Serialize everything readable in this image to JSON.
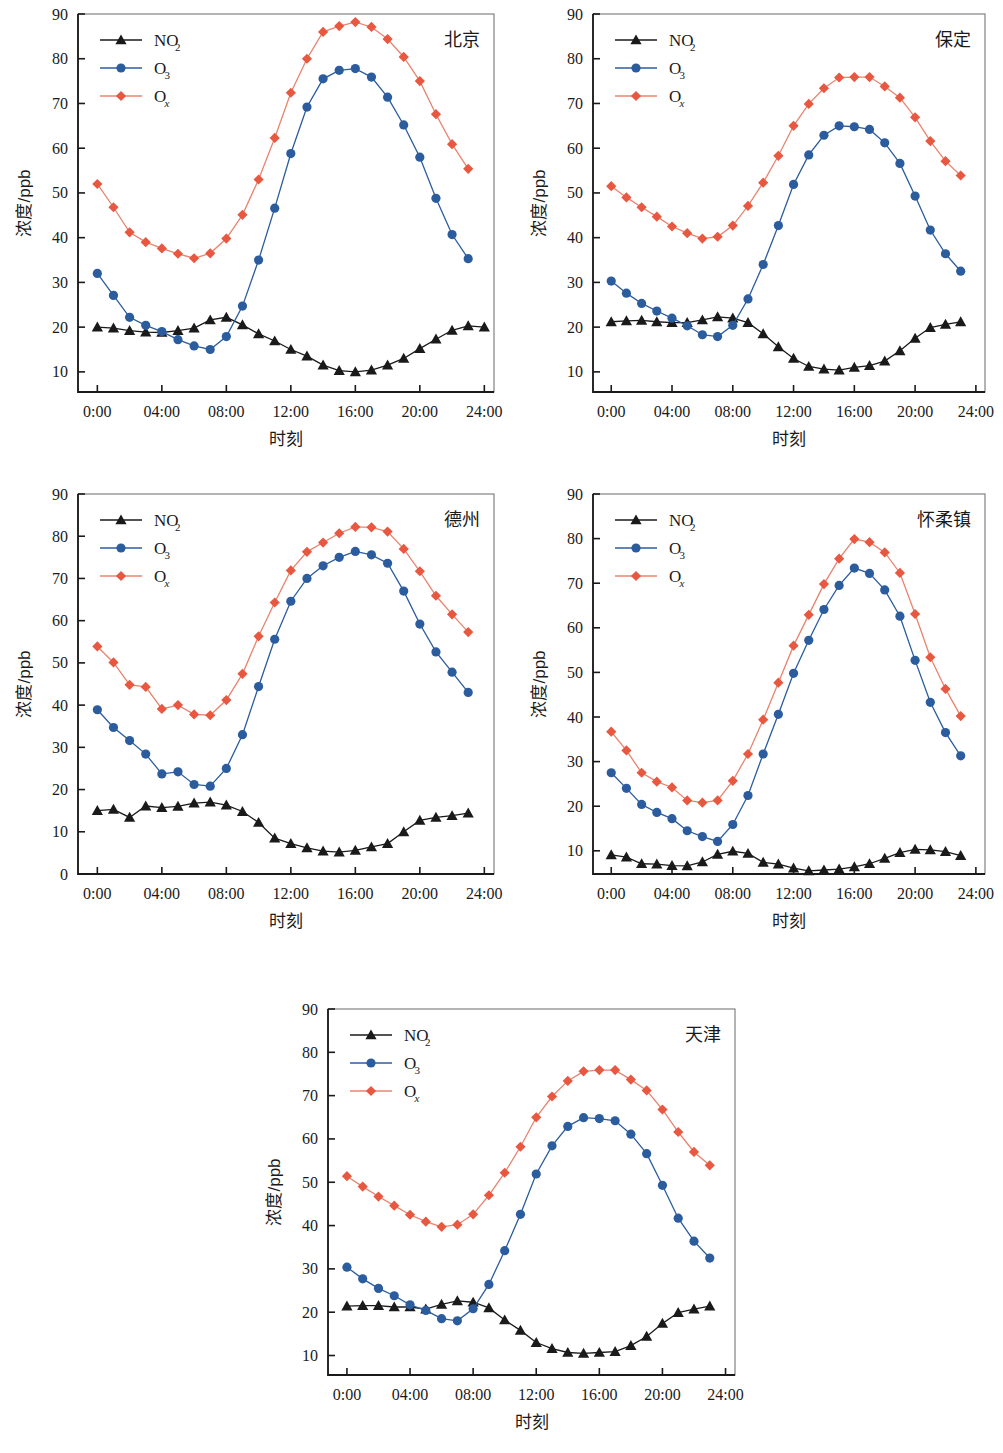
{
  "figure": {
    "panel_count": 5,
    "colors": {
      "no2": "#1a1a1a",
      "o3": "#2B5C9E",
      "ox": "#E8573F",
      "ox_line": "#E8846F",
      "axis": "#1a1a1a"
    },
    "shared": {
      "xlabel": "时刻",
      "ylabel": "浓度/ppb",
      "xticklabels": [
        "0:00",
        "04:00",
        "08:00",
        "12:00",
        "16:00",
        "20:00",
        "24:00"
      ],
      "xtickvalues": [
        0,
        4,
        8,
        12,
        16,
        20,
        24
      ],
      "xlim": [
        -1.2,
        24.6
      ],
      "legend": [
        {
          "label": "NO",
          "sub": "2",
          "sub_italic": false,
          "marker": "triangle",
          "color_key": "no2"
        },
        {
          "label": "O",
          "sub": "3",
          "sub_italic": false,
          "marker": "circle",
          "color_key": "o3"
        },
        {
          "label": "O",
          "sub": "x",
          "sub_italic": true,
          "marker": "diamond",
          "color_key": "ox"
        }
      ]
    }
  },
  "chart_data": [
    {
      "type": "line",
      "title": "北京",
      "panel_index": 0,
      "xlabel": "时刻",
      "ylabel": "浓度/ppb",
      "x": [
        0,
        1,
        2,
        3,
        4,
        5,
        6,
        7,
        8,
        9,
        10,
        11,
        12,
        13,
        14,
        15,
        16,
        17,
        18,
        19,
        20,
        21,
        22,
        23
      ],
      "xlim": [
        -1.2,
        24.6
      ],
      "ylim": [
        5.5,
        90
      ],
      "yticks": [
        10,
        20,
        30,
        40,
        50,
        60,
        70,
        80,
        90
      ],
      "yticklabels": [
        "10",
        "20",
        "30",
        "40",
        "50",
        "60",
        "70",
        "80",
        "90"
      ],
      "grid": false,
      "legend_position": "top-left",
      "series": [
        {
          "name": "NO2",
          "marker": "triangle",
          "color_key": "no2",
          "values": [
            20.0,
            19.8,
            19.2,
            18.9,
            18.8,
            19.2,
            19.8,
            21.6,
            22.2,
            20.5,
            18.5,
            16.9,
            15.0,
            13.5,
            11.5,
            10.3,
            10.0,
            10.4,
            11.5,
            13.0,
            15.2,
            17.3,
            19.3,
            20.3,
            20.0
          ]
        },
        {
          "name": "O3",
          "marker": "circle",
          "color_key": "o3",
          "values": [
            32.0,
            27.1,
            22.2,
            20.4,
            19.0,
            17.2,
            15.8,
            15.0,
            17.9,
            24.7,
            35.0,
            46.6,
            58.8,
            69.2,
            75.5,
            77.4,
            77.8,
            75.9,
            71.4,
            65.2,
            58.0,
            48.8,
            40.7,
            35.3
          ]
        },
        {
          "name": "Ox",
          "marker": "diamond",
          "color_key": "ox",
          "values": [
            52.0,
            46.8,
            41.2,
            39.0,
            37.6,
            36.4,
            35.4,
            36.5,
            39.8,
            45.1,
            53.0,
            62.3,
            72.4,
            80.0,
            86.0,
            87.3,
            88.2,
            87.1,
            84.4,
            80.4,
            75.0,
            67.6,
            60.9,
            55.4
          ]
        }
      ]
    },
    {
      "type": "line",
      "title": "保定",
      "panel_index": 1,
      "xlabel": "时刻",
      "ylabel": "浓度/ppb",
      "x": [
        0,
        1,
        2,
        3,
        4,
        5,
        6,
        7,
        8,
        9,
        10,
        11,
        12,
        13,
        14,
        15,
        16,
        17,
        18,
        19,
        20,
        21,
        22,
        23
      ],
      "xlim": [
        -1.2,
        24.6
      ],
      "ylim": [
        5.5,
        90
      ],
      "yticks": [
        10,
        20,
        30,
        40,
        50,
        60,
        70,
        80,
        90
      ],
      "yticklabels": [
        "10",
        "20",
        "30",
        "40",
        "50",
        "60",
        "70",
        "80",
        "90"
      ],
      "grid": false,
      "legend_position": "top-left",
      "series": [
        {
          "name": "NO2",
          "marker": "triangle",
          "color_key": "no2",
          "values": [
            21.2,
            21.4,
            21.5,
            21.2,
            21.0,
            21.0,
            21.6,
            22.3,
            22.0,
            21.0,
            18.5,
            15.6,
            13.0,
            11.2,
            10.6,
            10.4,
            11.0,
            11.4,
            12.4,
            14.7,
            17.5,
            19.9,
            20.6,
            21.2
          ]
        },
        {
          "name": "O3",
          "marker": "circle",
          "color_key": "o3",
          "values": [
            30.3,
            27.6,
            25.3,
            23.6,
            22.0,
            20.3,
            18.3,
            17.9,
            20.4,
            26.3,
            34.0,
            42.7,
            51.9,
            58.5,
            62.9,
            65.0,
            64.8,
            64.2,
            61.2,
            56.6,
            49.3,
            41.7,
            36.4,
            32.5
          ]
        },
        {
          "name": "Ox",
          "marker": "diamond",
          "color_key": "ox",
          "values": [
            51.5,
            49.0,
            46.8,
            44.7,
            42.5,
            41.0,
            39.8,
            40.2,
            42.7,
            47.1,
            52.3,
            58.3,
            65.0,
            69.9,
            73.4,
            75.8,
            75.9,
            75.9,
            73.8,
            71.3,
            66.9,
            61.6,
            57.1,
            53.9
          ]
        }
      ]
    },
    {
      "type": "line",
      "title": "德州",
      "panel_index": 2,
      "xlabel": "时刻",
      "ylabel": "浓度/ppb",
      "x": [
        0,
        1,
        2,
        3,
        4,
        5,
        6,
        7,
        8,
        9,
        10,
        11,
        12,
        13,
        14,
        15,
        16,
        17,
        18,
        19,
        20,
        21,
        22,
        23
      ],
      "xlim": [
        -1.2,
        24.6
      ],
      "ylim": [
        0,
        90
      ],
      "yticks": [
        0,
        10,
        20,
        30,
        40,
        50,
        60,
        70,
        80,
        90
      ],
      "yticklabels": [
        "0",
        "10",
        "20",
        "30",
        "40",
        "50",
        "60",
        "70",
        "80",
        "90"
      ],
      "grid": false,
      "legend_position": "top-left",
      "series": [
        {
          "name": "NO2",
          "marker": "triangle",
          "color_key": "no2",
          "values": [
            15.0,
            15.3,
            13.4,
            16.1,
            15.7,
            16.0,
            16.8,
            17.0,
            16.3,
            14.8,
            12.2,
            8.5,
            7.2,
            6.2,
            5.4,
            5.2,
            5.6,
            6.4,
            7.2,
            10.0,
            12.7,
            13.4,
            13.8,
            14.4
          ]
        },
        {
          "name": "O3",
          "marker": "circle",
          "color_key": "o3",
          "values": [
            38.9,
            34.7,
            31.6,
            28.4,
            23.7,
            24.2,
            21.2,
            20.8,
            25.0,
            33.0,
            44.4,
            55.6,
            64.6,
            70.0,
            73.0,
            75.0,
            76.4,
            75.6,
            73.6,
            67.0,
            59.2,
            52.6,
            47.8,
            43.0
          ]
        },
        {
          "name": "Ox",
          "marker": "diamond",
          "color_key": "ox",
          "values": [
            53.9,
            50.1,
            44.8,
            44.3,
            39.1,
            40.0,
            37.8,
            37.6,
            41.2,
            47.4,
            56.3,
            64.3,
            71.9,
            76.3,
            78.5,
            80.7,
            82.2,
            82.1,
            81.1,
            77.0,
            71.7,
            65.9,
            61.5,
            57.3
          ]
        }
      ]
    },
    {
      "type": "line",
      "title": "怀柔镇",
      "panel_index": 3,
      "xlabel": "时刻",
      "ylabel": "浓度/ppb",
      "x": [
        0,
        1,
        2,
        3,
        4,
        5,
        6,
        7,
        8,
        9,
        10,
        11,
        12,
        13,
        14,
        15,
        16,
        17,
        18,
        19,
        20,
        21,
        22,
        23
      ],
      "xlim": [
        -1.2,
        24.6
      ],
      "ylim": [
        4.8,
        90
      ],
      "yticks": [
        10,
        20,
        30,
        40,
        50,
        60,
        70,
        80,
        90
      ],
      "yticklabels": [
        "10",
        "20",
        "30",
        "40",
        "50",
        "60",
        "70",
        "80",
        "90"
      ],
      "grid": false,
      "legend_position": "top-left",
      "series": [
        {
          "name": "NO2",
          "marker": "triangle",
          "color_key": "no2",
          "values": [
            9.1,
            8.6,
            7.1,
            7.0,
            6.7,
            6.6,
            7.5,
            9.2,
            9.9,
            9.4,
            7.4,
            7.0,
            6.1,
            5.5,
            5.7,
            5.9,
            6.4,
            7.1,
            8.3,
            9.6,
            10.3,
            10.2,
            9.8,
            8.9
          ]
        },
        {
          "name": "O3",
          "marker": "circle",
          "color_key": "o3",
          "values": [
            27.5,
            24.0,
            20.4,
            18.6,
            17.2,
            14.5,
            13.2,
            12.1,
            15.9,
            22.4,
            31.7,
            40.6,
            49.8,
            57.2,
            64.1,
            69.5,
            73.4,
            72.2,
            68.5,
            62.6,
            52.7,
            43.3,
            36.5,
            31.3
          ]
        },
        {
          "name": "Ox",
          "marker": "diamond",
          "color_key": "ox",
          "values": [
            36.7,
            32.5,
            27.5,
            25.5,
            24.2,
            21.3,
            20.8,
            21.3,
            25.7,
            31.7,
            39.4,
            47.7,
            56.0,
            62.9,
            69.8,
            75.5,
            79.9,
            79.2,
            76.9,
            72.3,
            63.1,
            53.4,
            46.3,
            40.2
          ]
        }
      ]
    },
    {
      "type": "line",
      "title": "天津",
      "panel_index": 4,
      "xlabel": "时刻",
      "ylabel": "浓度/ppb",
      "x": [
        0,
        1,
        2,
        3,
        4,
        5,
        6,
        7,
        8,
        9,
        10,
        11,
        12,
        13,
        14,
        15,
        16,
        17,
        18,
        19,
        20,
        21,
        22,
        23
      ],
      "xlim": [
        -1.2,
        24.6
      ],
      "ylim": [
        5.5,
        90
      ],
      "yticks": [
        10,
        20,
        30,
        40,
        50,
        60,
        70,
        80,
        90
      ],
      "yticklabels": [
        "10",
        "20",
        "30",
        "40",
        "50",
        "60",
        "70",
        "80",
        "90"
      ],
      "grid": false,
      "legend_position": "top-left",
      "series": [
        {
          "name": "NO2",
          "marker": "triangle",
          "color_key": "no2",
          "values": [
            21.4,
            21.5,
            21.5,
            21.2,
            21.2,
            20.7,
            21.8,
            22.6,
            22.3,
            21.0,
            18.2,
            15.8,
            13.0,
            11.6,
            10.7,
            10.5,
            10.7,
            10.9,
            12.3,
            14.4,
            17.4,
            19.9,
            20.7,
            21.4
          ]
        },
        {
          "name": "O3",
          "marker": "circle",
          "color_key": "o3",
          "values": [
            30.4,
            27.7,
            25.5,
            23.8,
            21.7,
            20.4,
            18.5,
            18.0,
            20.8,
            26.4,
            34.2,
            42.6,
            51.9,
            58.4,
            62.9,
            64.9,
            64.7,
            64.2,
            61.1,
            56.6,
            49.3,
            41.7,
            36.4,
            32.5
          ]
        },
        {
          "name": "Ox",
          "marker": "diamond",
          "color_key": "ox",
          "values": [
            51.4,
            49.0,
            46.7,
            44.6,
            42.5,
            40.9,
            39.7,
            40.2,
            42.6,
            47.0,
            52.2,
            58.2,
            65.0,
            69.8,
            73.4,
            75.6,
            75.9,
            75.9,
            73.7,
            71.2,
            66.8,
            61.6,
            57.0,
            53.9
          ]
        }
      ]
    }
  ]
}
